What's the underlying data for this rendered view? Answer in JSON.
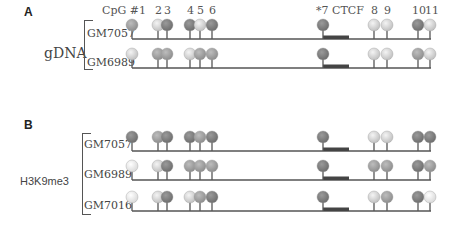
{
  "panels": [
    {
      "id": "A",
      "label": "A",
      "group_label": "gDNA",
      "header": {
        "cpg_prefix": "CpG #1",
        "numbers": [
          "2",
          "3",
          "4",
          "5",
          "6",
          "*7 CTCF",
          "8",
          "9",
          "10",
          "11"
        ]
      },
      "samples": [
        {
          "name": "GM7057",
          "states": [
            "mid",
            "light",
            "dark",
            "dark",
            "light",
            "dark",
            "dark",
            "light",
            "light",
            "dark",
            "light"
          ]
        },
        {
          "name": "GM6989",
          "states": [
            "light",
            "mid",
            "mid",
            "light",
            "mid",
            "mid",
            "dark",
            "light",
            "light",
            "mid",
            "light"
          ]
        }
      ]
    },
    {
      "id": "B",
      "label": "B",
      "group_label": "H3K9me3",
      "samples": [
        {
          "name": "GM7057",
          "states": [
            "dark",
            "mid",
            "dark",
            "dark",
            "mid",
            "dark",
            "dark",
            "light",
            "light",
            "dark",
            "dark"
          ]
        },
        {
          "name": "GM6989",
          "states": [
            "white",
            "light",
            "dark",
            "mid",
            "mid",
            "mid",
            "dark",
            "mid",
            "mid",
            "dark",
            "mid"
          ]
        },
        {
          "name": "GM7016",
          "states": [
            "white",
            "light",
            "dark",
            "light",
            "mid",
            "dark",
            "dark",
            "light",
            "mid",
            "dark",
            "white"
          ]
        }
      ]
    }
  ],
  "cpg_sites": [
    "1",
    "2",
    "3",
    "4",
    "5",
    "6",
    "7",
    "8",
    "9",
    "10",
    "11"
  ],
  "ctcf_site": "*7 CTCF",
  "colors": {
    "dark": "#7a7a7a",
    "mid": "#999999",
    "light": "#d8d8d8",
    "white": "#f2f2f2",
    "line": "#555555",
    "ctcf_box": "#444444"
  }
}
